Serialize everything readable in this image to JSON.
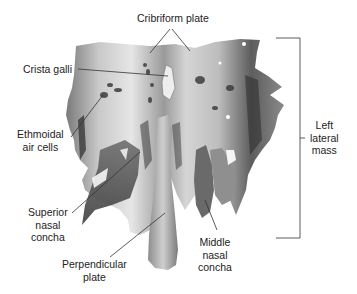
{
  "figure": {
    "labels": {
      "cribriform_plate": [
        "Cribriform plate"
      ],
      "crista_galli": [
        "Crista galli"
      ],
      "ethmoidal_air_cells": [
        "Ethmoidal",
        "air cells"
      ],
      "superior_nasal_concha": [
        "Superior",
        "nasal",
        "concha"
      ],
      "perpendicular_plate": [
        "Perpendicular",
        "plate"
      ],
      "middle_nasal_concha": [
        "Middle",
        "nasal",
        "concha"
      ],
      "left_lateral_mass": [
        "Left",
        "lateral",
        "mass"
      ]
    },
    "colors": {
      "bone_light": "#d8d8d8",
      "bone_mid": "#a6a6a6",
      "bone_dark": "#555555",
      "leader_line": "#333333",
      "text": "#222222"
    }
  }
}
